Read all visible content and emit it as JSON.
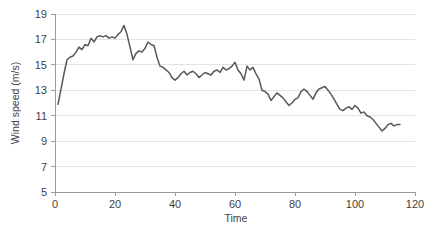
{
  "chart_data": {
    "type": "line",
    "title": "",
    "xlabel": "Time",
    "ylabel": "Wind speed (m/s)",
    "xlim": [
      0,
      120
    ],
    "ylim": [
      5,
      19
    ],
    "xticks": [
      0,
      20,
      40,
      60,
      80,
      100,
      120
    ],
    "yticks": [
      5,
      7,
      9,
      11,
      13,
      15,
      17,
      19
    ],
    "grid": "horizontal",
    "legend": "none",
    "line_color": "#58585a",
    "gridline_color": "#e3e3e3",
    "axis_color": "#9a9a9a",
    "series": [
      {
        "name": "Wind speed",
        "x": [
          1,
          2,
          3,
          4,
          5,
          6,
          7,
          8,
          9,
          10,
          11,
          12,
          13,
          14,
          15,
          16,
          17,
          18,
          19,
          20,
          21,
          22,
          23,
          24,
          25,
          26,
          27,
          28,
          29,
          30,
          31,
          32,
          33,
          34,
          35,
          36,
          37,
          38,
          39,
          40,
          41,
          42,
          43,
          44,
          45,
          46,
          47,
          48,
          49,
          50,
          51,
          52,
          53,
          54,
          55,
          56,
          57,
          58,
          59,
          60,
          61,
          62,
          63,
          64,
          65,
          66,
          67,
          68,
          69,
          70,
          71,
          72,
          73,
          74,
          75,
          76,
          77,
          78,
          79,
          80,
          81,
          82,
          83,
          84,
          85,
          86,
          87,
          88,
          89,
          90,
          91,
          92,
          93,
          94,
          95,
          96,
          97,
          98,
          99,
          100,
          101,
          102,
          103,
          104,
          105,
          106,
          107,
          108,
          109,
          110,
          111,
          112,
          113,
          114,
          115
        ],
        "values": [
          11.9,
          13.1,
          14.3,
          15.4,
          15.6,
          15.7,
          16.0,
          16.4,
          16.2,
          16.6,
          16.5,
          17.1,
          16.8,
          17.2,
          17.3,
          17.2,
          17.3,
          17.1,
          17.2,
          17.1,
          17.4,
          17.6,
          18.1,
          17.4,
          16.4,
          15.4,
          15.9,
          16.1,
          16.0,
          16.3,
          16.8,
          16.6,
          16.5,
          15.6,
          14.9,
          14.8,
          14.6,
          14.4,
          14.0,
          13.8,
          14.0,
          14.3,
          14.5,
          14.2,
          14.4,
          14.5,
          14.3,
          14.0,
          14.2,
          14.4,
          14.3,
          14.2,
          14.5,
          14.6,
          14.4,
          14.8,
          14.6,
          14.7,
          14.9,
          15.2,
          14.6,
          14.3,
          13.8,
          14.9,
          14.6,
          14.8,
          14.3,
          13.9,
          13.0,
          12.9,
          12.7,
          12.2,
          12.5,
          12.8,
          12.6,
          12.4,
          12.1,
          11.8,
          12.0,
          12.3,
          12.4,
          12.9,
          13.1,
          12.9,
          12.6,
          12.3,
          12.8,
          13.1,
          13.2,
          13.3,
          13.0,
          12.7,
          12.3,
          11.9,
          11.5,
          11.4,
          11.6,
          11.7,
          11.5,
          11.8,
          11.6,
          11.2,
          11.3,
          11.0,
          10.9,
          10.7,
          10.4,
          10.1,
          9.8,
          10.0,
          10.3,
          10.4,
          10.2,
          10.3,
          10.3
        ]
      }
    ]
  }
}
